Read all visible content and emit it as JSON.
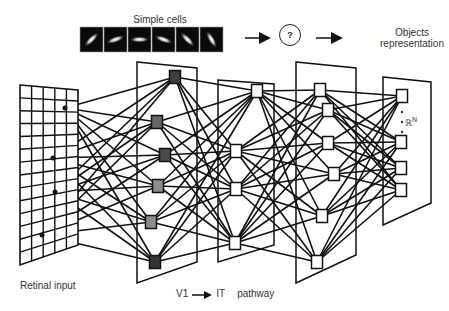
{
  "labels": {
    "simple_cells": "Simple cells",
    "unknown_step": "?",
    "objects_line1": "Objects",
    "objects_line2": "representation",
    "retinal_input": "Retinal input",
    "pathway_start": "V1",
    "pathway_end": "IT",
    "pathway_word": "pathway",
    "feature_space": "ℝ",
    "feature_space_exp": "N"
  },
  "simple_cells": {
    "count": 6,
    "orientations_deg": [
      45,
      20,
      0,
      -20,
      -45,
      -60
    ]
  },
  "layers": [
    {
      "name": "retina",
      "type": "grid",
      "cols": 5,
      "rows": 14,
      "nodes": [
        [
          65,
          108
        ],
        [
          53,
          158
        ],
        [
          55,
          192
        ],
        [
          42,
          235
        ]
      ]
    },
    {
      "name": "layer-2",
      "nodes": [
        [
          175,
          77,
          "#3d3d3d"
        ],
        [
          157,
          122,
          "#666666"
        ],
        [
          165,
          155,
          "#4a4a4a"
        ],
        [
          158,
          186,
          "#8c8c8c"
        ],
        [
          151,
          222,
          "#8c8c8c"
        ],
        [
          155,
          262,
          "#333333"
        ]
      ]
    },
    {
      "name": "layer-3",
      "nodes": [
        [
          257,
          91,
          "#ffffff"
        ],
        [
          236,
          151,
          "#ffffff"
        ],
        [
          236,
          189,
          "#ffffff"
        ],
        [
          235,
          243,
          "#ffffff"
        ]
      ]
    },
    {
      "name": "layer-4",
      "nodes": [
        [
          320,
          90,
          "#ffffff"
        ],
        [
          328,
          110,
          "#ffffff"
        ],
        [
          328,
          143,
          "#ffffff"
        ],
        [
          334,
          174,
          "#ffffff"
        ],
        [
          322,
          216,
          "#ffffff"
        ],
        [
          317,
          262,
          "#ffffff"
        ]
      ]
    },
    {
      "name": "output",
      "nodes": [
        [
          402,
          96,
          "#ffffff"
        ],
        [
          401,
          142,
          "#ffffff"
        ],
        [
          401,
          168,
          "#ffffff"
        ],
        [
          401,
          190,
          "#ffffff"
        ]
      ]
    }
  ]
}
